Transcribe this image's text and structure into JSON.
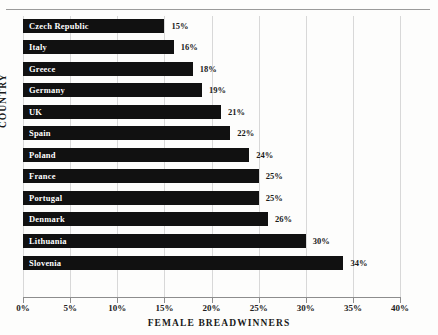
{
  "chart_data": {
    "type": "bar",
    "orientation": "horizontal",
    "title": "",
    "xlabel": "FEMALE BREADWINNERS",
    "ylabel": "COUNTRY",
    "xlim": [
      0,
      40
    ],
    "xticks": [
      "0%",
      "5%",
      "10%",
      "15%",
      "20%",
      "25%",
      "30%",
      "35%",
      "40%"
    ],
    "xtick_values": [
      0,
      5,
      10,
      15,
      20,
      25,
      30,
      35,
      40
    ],
    "grid": "vertical",
    "legend": "none",
    "categories": [
      "Czech Republic",
      "Italy",
      "Greece",
      "Germany",
      "UK",
      "Spain",
      "Poland",
      "France",
      "Portugal",
      "Denmark",
      "Lithuania",
      "Slovenia"
    ],
    "values": [
      15,
      16,
      18,
      19,
      21,
      22,
      24,
      25,
      25,
      26,
      30,
      34
    ],
    "data_labels": [
      "15%",
      "16%",
      "18%",
      "19%",
      "21%",
      "22%",
      "24%",
      "25%",
      "25%",
      "26%",
      "30%",
      "34%"
    ],
    "colors": {
      "bar": "#111111",
      "bar_label_text": "#ffffff",
      "value_label_text": "#1a1a1a",
      "gridline": "#d8d8d8",
      "axis": "#8d8d8d",
      "background": "#fdfdfc"
    }
  }
}
